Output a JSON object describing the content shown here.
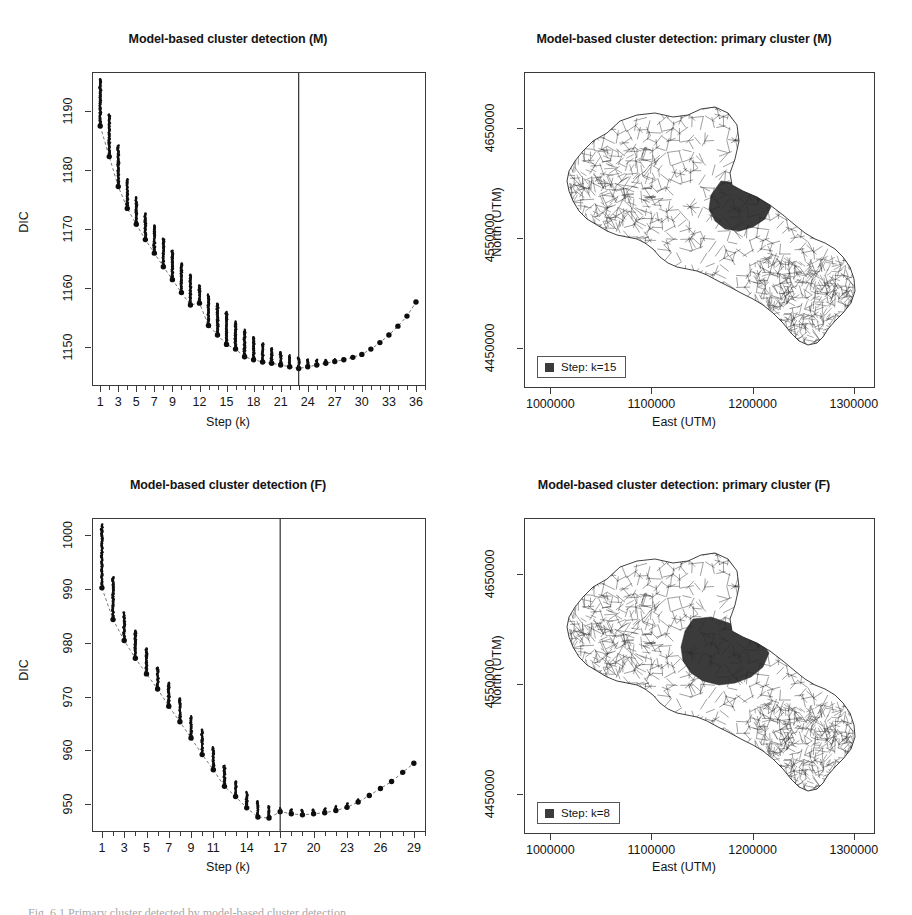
{
  "figure": {
    "caption": "Fig. 6.1  Primary cluster detected by model-based cluster detection",
    "background": "#ffffff",
    "line_color": "#3a3a3a",
    "point_color": "#111111",
    "cluster_fill": "#3b3b3b"
  },
  "panels": {
    "top_left": {
      "title": "Model-based cluster detection (M)",
      "xlabel": "Step (k)",
      "ylabel": "DIC"
    },
    "top_right": {
      "title": "Model-based cluster detection: primary cluster (M)",
      "xlabel": "East (UTM)",
      "ylabel": "North (UTM)",
      "legend_label": "Step: k=15"
    },
    "bottom_left": {
      "title": "Model-based cluster detection (F)",
      "xlabel": "Step (k)",
      "ylabel": "DIC"
    },
    "bottom_right": {
      "title": "Model-based cluster detection: primary cluster (F)",
      "xlabel": "East (UTM)",
      "ylabel": "North (UTM)",
      "legend_label": "Step: k=8"
    }
  },
  "chart_data": [
    {
      "id": "dic-male",
      "type": "scatter",
      "title": "Model-based cluster detection (M)",
      "xlabel": "Step (k)",
      "ylabel": "DIC",
      "xlim": [
        0.2,
        37.0
      ],
      "ylim": [
        1143.5,
        1196.5
      ],
      "xticks": [
        1,
        3,
        5,
        7,
        9,
        12,
        15,
        18,
        21,
        24,
        27,
        30,
        33,
        36
      ],
      "xtick_labels": [
        "1",
        "3",
        "5",
        "7",
        "9",
        "12",
        "15",
        "18",
        "21",
        "24",
        "27",
        "30",
        "33",
        "36"
      ],
      "minor_xticks_every": 1,
      "yticks": [
        1150,
        1160,
        1170,
        1180,
        1190
      ],
      "ytick_labels": [
        "1150",
        "1160",
        "1170",
        "1180",
        "1190"
      ],
      "grid": false,
      "legend": "none",
      "vline_x": 23,
      "x": [
        1,
        2,
        3,
        4,
        5,
        6,
        7,
        8,
        9,
        10,
        11,
        12,
        13,
        14,
        15,
        16,
        17,
        18,
        19,
        20,
        21,
        22,
        23,
        24,
        25,
        26,
        27,
        28,
        29,
        30,
        31,
        32,
        33,
        34,
        35,
        36
      ],
      "series": [
        {
          "name": "Selected DIC (chosen step)",
          "marker": "filled-circle",
          "values": [
            1187.5,
            1182.3,
            1177.2,
            1173.5,
            1170.8,
            1168.2,
            1165.9,
            1163.6,
            1161.4,
            1159.2,
            1157.1,
            1157.4,
            1153.6,
            1152.0,
            1150.4,
            1149.6,
            1148.3,
            1147.8,
            1147.4,
            1147.2,
            1146.9,
            1146.6,
            1146.3,
            1146.6,
            1146.9,
            1147.2,
            1147.5,
            1147.8,
            1148.2,
            1148.7,
            1149.6,
            1150.7,
            1152.0,
            1153.5,
            1155.2,
            1157.6
          ]
        },
        {
          "name": "Candidate DIC cloud upper bound",
          "marker": "small-dots",
          "values": [
            1195.4,
            1189.5,
            1184.2,
            1178.5,
            1175.4,
            1172.6,
            1170.6,
            1168.4,
            1166.3,
            1164.1,
            1162.2,
            1160.4,
            1158.9,
            1157.3,
            1155.9,
            1154.3,
            1152.9,
            1151.6,
            1150.6,
            1149.8,
            1149.1,
            1148.6,
            1148.1,
            1147.9,
            1147.8,
            1147.8,
            1147.9,
            1148.0,
            1148.3,
            1148.7,
            1149.6,
            1150.7,
            1152.0,
            1153.5,
            1155.2,
            1157.6
          ]
        }
      ],
      "notes": "Each step k shows a vertical cloud of candidate DIC values; the large filled dot marks the selected model. A dashed line traces the selected values. The vertical line marks the stopping step k=23."
    },
    {
      "id": "dic-female",
      "type": "scatter",
      "title": "Model-based cluster detection (F)",
      "xlabel": "Step (k)",
      "ylabel": "DIC",
      "xlim": [
        0.2,
        30.0
      ],
      "ylim": [
        945.0,
        1003.0
      ],
      "xticks": [
        1,
        3,
        5,
        7,
        9,
        11,
        14,
        17,
        20,
        23,
        26,
        29
      ],
      "xtick_labels": [
        "1",
        "3",
        "5",
        "7",
        "9",
        "11",
        "14",
        "17",
        "20",
        "23",
        "26",
        "29"
      ],
      "minor_xticks_every": 1,
      "yticks": [
        950,
        960,
        970,
        980,
        990,
        1000
      ],
      "ytick_labels": [
        "950",
        "960",
        "970",
        "980",
        "990",
        "1000"
      ],
      "grid": false,
      "legend": "none",
      "vline_x": 17,
      "x": [
        1,
        2,
        3,
        4,
        5,
        6,
        7,
        8,
        9,
        10,
        11,
        12,
        13,
        14,
        15,
        16,
        17,
        18,
        19,
        20,
        21,
        22,
        23,
        24,
        25,
        26,
        27,
        28,
        29
      ],
      "series": [
        {
          "name": "Selected DIC (chosen step)",
          "marker": "filled-circle",
          "values": [
            990.2,
            984.3,
            980.4,
            977.1,
            974.2,
            971.4,
            968.2,
            965.3,
            962.3,
            959.2,
            956.4,
            953.3,
            951.4,
            949.3,
            947.6,
            947.4,
            948.6,
            948.2,
            948.0,
            948.2,
            948.4,
            948.8,
            949.4,
            950.4,
            951.6,
            952.9,
            954.2,
            955.9,
            957.6
          ]
        },
        {
          "name": "Candidate DIC cloud upper bound",
          "marker": "small-dots",
          "values": [
            1002.0,
            992.2,
            985.6,
            982.2,
            978.9,
            975.4,
            972.6,
            969.6,
            966.4,
            963.8,
            960.6,
            957.2,
            954.2,
            952.3,
            950.6,
            949.6,
            949.3,
            949.0,
            948.9,
            949.0,
            949.2,
            949.6,
            950.1,
            950.9,
            951.9,
            953.1,
            954.4,
            956.0,
            957.6
          ]
        }
      ],
      "notes": "Same structure as panel (M). The vertical line marks the stopping step k=17."
    },
    {
      "id": "map-male",
      "type": "map",
      "title": "Model-based cluster detection: primary cluster (M)",
      "xlabel": "East (UTM)",
      "ylabel": "North (UTM)",
      "xticks": [
        1000000,
        1100000,
        1200000,
        1300000
      ],
      "xtick_labels": [
        "1000000",
        "1100000",
        "1200000",
        "1300000"
      ],
      "yticks": [
        4450000,
        4550000,
        4650000
      ],
      "ytick_labels": [
        "4450000",
        "4550000",
        "4650000"
      ],
      "legend_label": "Step: k=15",
      "region": "Apulia (Puglia), Italy — municipality boundaries",
      "highlight_description": "Shaded primary cluster in the north-central area of the region"
    },
    {
      "id": "map-female",
      "type": "map",
      "title": "Model-based cluster detection: primary cluster (F)",
      "xlabel": "East (UTM)",
      "ylabel": "North (UTM)",
      "xticks": [
        1000000,
        1100000,
        1200000,
        1300000
      ],
      "xtick_labels": [
        "1000000",
        "1100000",
        "1200000",
        "1300000"
      ],
      "yticks": [
        4450000,
        4550000,
        4650000
      ],
      "ytick_labels": [
        "4450000",
        "4550000",
        "4650000"
      ],
      "legend_label": "Step: k=8",
      "region": "Apulia (Puglia), Italy — municipality boundaries",
      "highlight_description": "Larger shaded primary cluster in the north-central area, extending further west than the (M) cluster"
    }
  ]
}
